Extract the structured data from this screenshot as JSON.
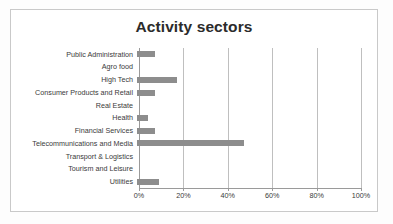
{
  "chart_data": {
    "type": "bar",
    "orientation": "horizontal",
    "title": "Activity sectors",
    "xlabel": "",
    "ylabel": "",
    "xlim": [
      0,
      100
    ],
    "xunit": "%",
    "grid": true,
    "legend": "none",
    "bar_color": "#8d8d8d",
    "title_color": "#2b2b2b",
    "gridline_color": "#bfbfbf",
    "axis_color": "#9a9a9a",
    "xticks": [
      "0%",
      "20%",
      "40%",
      "60%",
      "80%",
      "100%"
    ],
    "xtick_values": [
      0,
      20,
      40,
      60,
      80,
      100
    ],
    "categories": [
      "Public Administration",
      "Agro food",
      "High Tech",
      "Consumer Products and Retail",
      "Real Estate",
      "Health",
      "Financial Services",
      "Telecommunications and Media",
      "Transport & Logistics",
      "Tourism and Leisure",
      "Utilities"
    ],
    "values": [
      8,
      0,
      18,
      8,
      0,
      5,
      8,
      48,
      0,
      0,
      10
    ]
  }
}
